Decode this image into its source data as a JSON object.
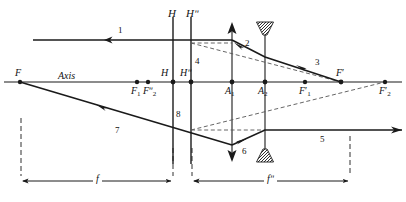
{
  "figure": {
    "axis_label": "Axis",
    "stroke_color": "#1a1a1a",
    "dash_color": "#555555",
    "background": "#ffffff"
  },
  "axis": {
    "label": "Axis",
    "y": 82,
    "x_start": 4,
    "x_end": 402
  },
  "principal_planes": [
    {
      "name": "H",
      "label_top": "H",
      "label_axis": "H",
      "x": 173
    },
    {
      "name": "H2",
      "label_top": "Hʺ",
      "label_axis": "Hʺ",
      "x": 191
    }
  ],
  "lenses": [
    {
      "name": "converging-lens",
      "label": "A",
      "sub": "1",
      "x": 232,
      "type": "converging"
    },
    {
      "name": "diverging-lens",
      "label": "A",
      "sub": "2",
      "x": 265,
      "type": "diverging"
    }
  ],
  "focal_points": [
    {
      "name": "F",
      "label": "F",
      "sub": "",
      "prime": "",
      "x": 20,
      "y": 82,
      "dot": true
    },
    {
      "name": "F1",
      "label": "F",
      "sub": "1",
      "prime": "",
      "x": 137,
      "y": 82,
      "dot": true
    },
    {
      "name": "F2dprime",
      "label": "F",
      "sub": "2",
      "prime": "ʺ",
      "x": 148,
      "y": 82,
      "dot": true
    },
    {
      "name": "H-axis",
      "label": "H",
      "sub": "",
      "prime": "",
      "x": 173,
      "y": 82,
      "dot": true
    },
    {
      "name": "H2-axis",
      "label": "H",
      "sub": "",
      "prime": "ʺ",
      "x": 191,
      "y": 82,
      "dot": true
    },
    {
      "name": "A1-axis",
      "label": "A",
      "sub": "1",
      "prime": "",
      "x": 232,
      "y": 82,
      "dot": true
    },
    {
      "name": "A2-axis",
      "label": "A",
      "sub": "2",
      "prime": "",
      "x": 265,
      "y": 82,
      "dot": true
    },
    {
      "name": "F1prime",
      "label": "F",
      "sub": "1",
      "prime": "′",
      "x": 305,
      "y": 82,
      "dot": true
    },
    {
      "name": "Fprime",
      "label": "F",
      "sub": "",
      "prime": "′",
      "x": 341,
      "y": 82,
      "dot": true
    },
    {
      "name": "F2prime",
      "label": "F",
      "sub": "2",
      "prime": "′",
      "x": 385,
      "y": 82,
      "dot": true
    }
  ],
  "ray_labels": [
    {
      "id": "1",
      "text": "1",
      "x": 120,
      "y": 31
    },
    {
      "id": "2",
      "text": "2",
      "x": 247,
      "y": 44
    },
    {
      "id": "3",
      "text": "3",
      "x": 317,
      "y": 63
    },
    {
      "id": "4",
      "text": "4",
      "x": 197,
      "y": 62
    },
    {
      "id": "5",
      "text": "5",
      "x": 322,
      "y": 140
    },
    {
      "id": "6",
      "text": "6",
      "x": 244,
      "y": 152
    },
    {
      "id": "7",
      "text": "7",
      "x": 117,
      "y": 131
    },
    {
      "id": "8",
      "text": "8",
      "x": 178,
      "y": 115
    }
  ],
  "dimensions": [
    {
      "name": "f",
      "label": "f",
      "x_start": 21,
      "x_end": 173,
      "y": 181
    },
    {
      "name": "f2",
      "label": "fʺ",
      "x_start": 192,
      "x_end": 350,
      "y": 181
    }
  ],
  "rays": {
    "incident_upper": {
      "from_x": 33,
      "y": 40,
      "to_x": 232
    },
    "upper_exit_to_Fprime": {
      "points": "232,40 265,59 341,82"
    },
    "lower_from_F": {
      "points": "20,82 232,145"
    },
    "lower_exit": {
      "points": "232,145 265,130 402,130"
    },
    "dashed_upper": {
      "points": "191,43 341,82"
    },
    "dashed_lower": {
      "points": "191,130 385,82"
    }
  }
}
